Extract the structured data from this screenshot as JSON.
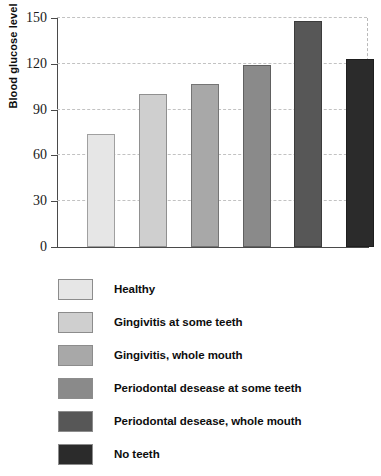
{
  "chart_data": {
    "type": "bar",
    "title": "",
    "subtitle": "",
    "xlabel": "",
    "ylabel": "Blood glucose level",
    "ylim": [
      0,
      150
    ],
    "yticks": [
      0,
      30,
      60,
      90,
      120,
      150
    ],
    "ytick_labels": [
      "0",
      "30",
      "60",
      "90",
      "120",
      "150"
    ],
    "grid": "horizontal-dashed",
    "legend_position": "below",
    "categories": [
      "Healthy",
      "Gingivitis at some teeth",
      "Gingivitis, whole mouth",
      "Periodontal desease at some teeth",
      "Periodontal desease, whole mouth",
      "No teeth"
    ],
    "values": [
      74,
      100,
      107,
      119,
      148,
      123
    ],
    "colors": [
      "#e6e6e6",
      "#cfcfcf",
      "#a8a8a8",
      "#8a8a8a",
      "#575757",
      "#2b2b2b"
    ]
  },
  "legend": {
    "items": [
      {
        "label": "Healthy",
        "color": "#e6e6e6"
      },
      {
        "label": "Gingivitis at some teeth",
        "color": "#cfcfcf"
      },
      {
        "label": "Gingivitis, whole mouth",
        "color": "#a8a8a8"
      },
      {
        "label": "Periodontal desease at some teeth",
        "color": "#8a8a8a"
      },
      {
        "label": "Periodontal desease, whole mouth",
        "color": "#575757"
      },
      {
        "label": "No teeth",
        "color": "#2b2b2b"
      }
    ]
  }
}
